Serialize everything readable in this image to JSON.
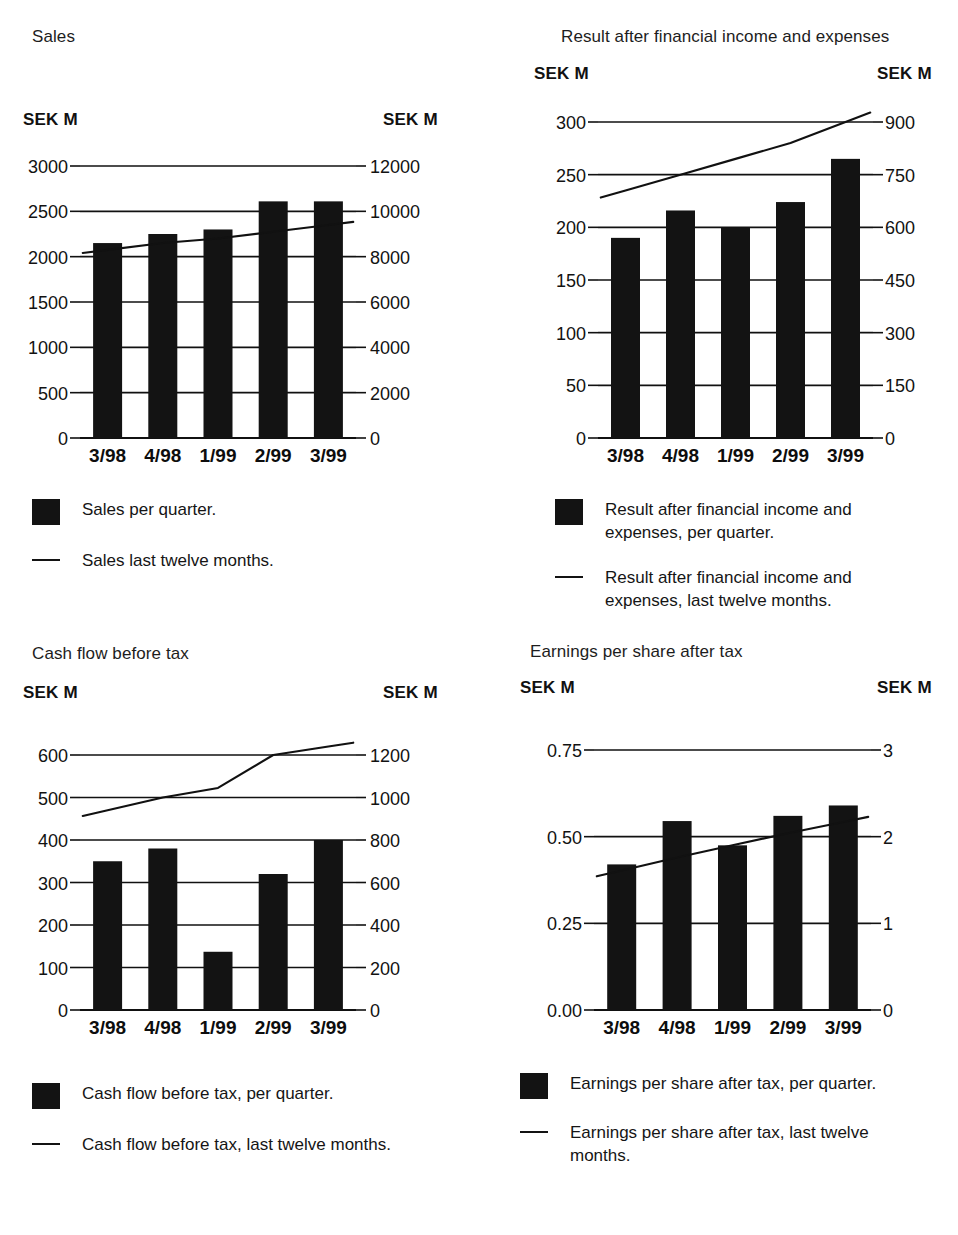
{
  "charts": [
    {
      "id": "sales",
      "title": "Sales",
      "left_unit": "SEK M",
      "right_unit": "SEK M",
      "legend": {
        "bar_label": "Sales per quarter.",
        "line_label": "Sales last twelve months."
      },
      "chart_data": {
        "type": "bar",
        "title": "Sales",
        "xlabel": "",
        "ylabel": "SEK M",
        "categories": [
          "3/98",
          "4/98",
          "1/99",
          "2/99",
          "3/99"
        ],
        "series": [
          {
            "name": "Sales per quarter.",
            "type": "bar",
            "axis": "left",
            "values": [
              2150,
              2250,
              2300,
              2610,
              2610
            ]
          },
          {
            "name": "Sales last twelve months.",
            "type": "line",
            "axis": "right",
            "values": [
              8300,
              8600,
              8800,
              9100,
              9400
            ]
          }
        ],
        "left_axis": {
          "label": "SEK M",
          "ticks": [
            "0",
            "500",
            "1000",
            "1500",
            "2000",
            "2500",
            "3000"
          ],
          "min": 0,
          "max": 3000
        },
        "right_axis": {
          "label": "SEK M",
          "ticks": [
            "0",
            "2000",
            "4000",
            "6000",
            "8000",
            "10000",
            "12000"
          ],
          "min": 0,
          "max": 12000
        },
        "grid": true,
        "legend_position": "below"
      }
    },
    {
      "id": "result",
      "title": "Result after financial income and expenses",
      "left_unit": "SEK M",
      "right_unit": "SEK M",
      "legend": {
        "bar_label": "Result after financial income and\nexpenses, per quarter.",
        "line_label": "Result after financial income and\nexpenses, last twelve months."
      },
      "chart_data": {
        "type": "bar",
        "title": "Result after financial income and expenses",
        "xlabel": "",
        "ylabel": "SEK M",
        "categories": [
          "3/98",
          "4/98",
          "1/99",
          "2/99",
          "3/99"
        ],
        "series": [
          {
            "name": "Result after financial income and expenses, per quarter.",
            "type": "bar",
            "axis": "left",
            "values": [
              190,
              216,
              200,
              224,
              265
            ]
          },
          {
            "name": "Result after financial income and expenses, last twelve months.",
            "type": "line",
            "axis": "right",
            "values": [
              705,
              750,
              795,
              840,
              900
            ]
          }
        ],
        "left_axis": {
          "label": "SEK M",
          "ticks": [
            "0",
            "50",
            "100",
            "150",
            "200",
            "250",
            "300"
          ],
          "min": 0,
          "max": 300
        },
        "right_axis": {
          "label": "SEK M",
          "ticks": [
            "0",
            "150",
            "300",
            "450",
            "600",
            "750",
            "900"
          ],
          "min": 0,
          "max": 900
        },
        "grid": true,
        "legend_position": "below"
      }
    },
    {
      "id": "cashflow",
      "title": "Cash flow before tax",
      "left_unit": "SEK M",
      "right_unit": "SEK M",
      "legend": {
        "bar_label": "Cash flow before tax, per quarter.",
        "line_label": "Cash flow before tax, last twelve months."
      },
      "chart_data": {
        "type": "bar",
        "title": "Cash flow before tax",
        "xlabel": "",
        "ylabel": "SEK M",
        "categories": [
          "3/98",
          "4/98",
          "1/99",
          "2/99",
          "3/99"
        ],
        "series": [
          {
            "name": "Cash flow before tax, per quarter.",
            "type": "bar",
            "axis": "left",
            "values": [
              350,
              380,
              137,
              320,
              400
            ]
          },
          {
            "name": "Cash flow before tax, last twelve months.",
            "type": "line",
            "axis": "right",
            "values": [
              940,
              1000,
              1045,
              1200,
              1240
            ]
          }
        ],
        "left_axis": {
          "label": "SEK M",
          "ticks": [
            "0",
            "100",
            "200",
            "300",
            "400",
            "500",
            "600"
          ],
          "min": 0,
          "max": 600
        },
        "right_axis": {
          "label": "SEK M",
          "ticks": [
            "0",
            "200",
            "400",
            "600",
            "800",
            "1000",
            "1200"
          ],
          "min": 0,
          "max": 1200
        },
        "grid": true,
        "legend_position": "below"
      }
    },
    {
      "id": "eps",
      "title": "Earnings per share after tax",
      "left_unit": "SEK M",
      "right_unit": "SEK M",
      "legend": {
        "bar_label": "Earnings per share after tax, per quarter.",
        "line_label": "Earnings per share after tax, last twelve\nmonths."
      },
      "chart_data": {
        "type": "bar",
        "title": "Earnings per share after tax",
        "xlabel": "",
        "ylabel": "SEK M",
        "categories": [
          "3/98",
          "4/98",
          "1/99",
          "2/99",
          "3/99"
        ],
        "series": [
          {
            "name": "Earnings per share after tax, per quarter.",
            "type": "bar",
            "axis": "left",
            "values": [
              0.42,
              0.545,
              0.475,
              0.56,
              0.59
            ]
          },
          {
            "name": "Earnings per share after tax, last twelve months.",
            "type": "line",
            "axis": "right",
            "values": [
              1.61,
              1.76,
              1.9,
              2.04,
              2.17
            ]
          }
        ],
        "left_axis": {
          "label": "SEK M",
          "ticks": [
            "0.00",
            "0.25",
            "0.50",
            "0.75"
          ],
          "min": 0,
          "max": 0.75
        },
        "right_axis": {
          "label": "SEK M",
          "ticks": [
            "0",
            "1",
            "2",
            "3"
          ],
          "min": 0,
          "max": 3
        },
        "grid": true,
        "legend_position": "below"
      }
    }
  ]
}
